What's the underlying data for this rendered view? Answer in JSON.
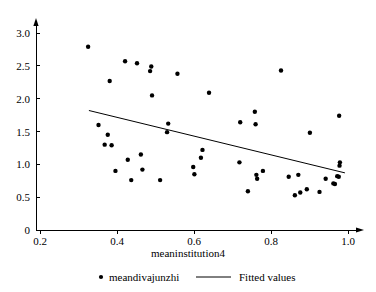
{
  "chart_data": {
    "type": "scatter",
    "title": "",
    "xlabel": "meaninstitution4",
    "ylabel": "",
    "xlim": [
      0.17,
      1.04
    ],
    "ylim": [
      0.0,
      3.22
    ],
    "grid": false,
    "legend_position": "bottom",
    "xticks": [
      0.2,
      0.4,
      0.6,
      0.8,
      1.0
    ],
    "xtick_labels": [
      "0.2",
      "0.4",
      "0.6",
      "0.8",
      "1.0"
    ],
    "yticks": [
      0,
      0.5,
      1.0,
      1.5,
      2.0,
      2.5,
      3.0
    ],
    "ytick_labels": [
      "0",
      "0.5",
      "1.0",
      "1.5",
      "2.0",
      "2.5",
      "3.0"
    ],
    "series": [
      {
        "name": "meandivajunzhi",
        "type": "scatter",
        "marker": "circle",
        "color": "#000000",
        "points": [
          [
            0.325,
            2.79
          ],
          [
            0.352,
            1.6
          ],
          [
            0.368,
            1.3
          ],
          [
            0.376,
            1.45
          ],
          [
            0.381,
            2.27
          ],
          [
            0.386,
            1.29
          ],
          [
            0.396,
            0.9
          ],
          [
            0.421,
            2.57
          ],
          [
            0.428,
            1.07
          ],
          [
            0.437,
            0.76
          ],
          [
            0.452,
            2.54
          ],
          [
            0.462,
            1.15
          ],
          [
            0.466,
            0.92
          ],
          [
            0.486,
            2.42
          ],
          [
            0.489,
            2.49
          ],
          [
            0.491,
            2.05
          ],
          [
            0.512,
            0.76
          ],
          [
            0.53,
            1.49
          ],
          [
            0.533,
            1.62
          ],
          [
            0.557,
            2.38
          ],
          [
            0.598,
            0.96
          ],
          [
            0.601,
            0.85
          ],
          [
            0.618,
            1.1
          ],
          [
            0.622,
            1.22
          ],
          [
            0.639,
            2.09
          ],
          [
            0.718,
            1.03
          ],
          [
            0.72,
            1.64
          ],
          [
            0.74,
            0.59
          ],
          [
            0.758,
            1.8
          ],
          [
            0.76,
            1.61
          ],
          [
            0.762,
            0.84
          ],
          [
            0.764,
            0.78
          ],
          [
            0.779,
            0.9
          ],
          [
            0.826,
            2.43
          ],
          [
            0.846,
            0.81
          ],
          [
            0.862,
            0.53
          ],
          [
            0.871,
            0.84
          ],
          [
            0.876,
            0.57
          ],
          [
            0.893,
            0.62
          ],
          [
            0.901,
            1.48
          ],
          [
            0.926,
            0.58
          ],
          [
            0.942,
            0.78
          ],
          [
            0.962,
            0.71
          ],
          [
            0.966,
            0.7
          ],
          [
            0.972,
            0.82
          ],
          [
            0.976,
            0.81
          ],
          [
            0.977,
            1.74
          ],
          [
            0.978,
            0.98
          ],
          [
            0.979,
            1.03
          ]
        ]
      },
      {
        "name": "Fitted values",
        "type": "line",
        "color": "#000000",
        "endpoints": [
          [
            0.327,
            1.82
          ],
          [
            0.992,
            0.87
          ]
        ]
      }
    ],
    "legend": [
      {
        "label": "meandivajunzhi",
        "marker": "circle"
      },
      {
        "label": "Fitted values",
        "marker": "line"
      }
    ]
  }
}
